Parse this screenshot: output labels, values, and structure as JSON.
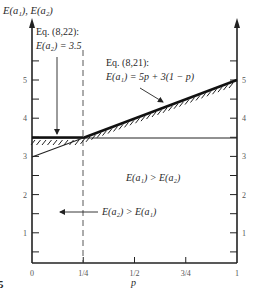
{
  "figure": {
    "y_axis_label": "E(a₁), E(a₂)",
    "x_axis_label": "p",
    "figure_number_fragment": "5",
    "x_ticks": [
      {
        "value": 0,
        "label": "0"
      },
      {
        "value": 0.25,
        "label": "1/4"
      },
      {
        "value": 0.5,
        "label": "1/2"
      },
      {
        "value": 0.75,
        "label": "3/4"
      },
      {
        "value": 1,
        "label": "1"
      }
    ],
    "y_ticks_labeled": [
      {
        "value": 1,
        "label": "1"
      },
      {
        "value": 2,
        "label": "2"
      },
      {
        "value": 3,
        "label": "3"
      },
      {
        "value": 4,
        "label": "4"
      },
      {
        "value": 5,
        "label": "5"
      }
    ],
    "y_minor_ticks": [
      0.5,
      1.5,
      2.5,
      3.5,
      4.5,
      5.5
    ],
    "annotations": {
      "eq822_line1": "Eq. (8,22):",
      "eq822_line2": "E(a₂) = 3.5",
      "eq821_line1": "Eq. (8,21):",
      "eq821_line2": "E(a₁) = 5p + 3(1 − p)",
      "region_right": "E(a₁) > E(a₂)",
      "region_left": "E(a₂) > E(a₁)"
    },
    "lines": [
      {
        "name": "E(a2)",
        "equation": "3.5",
        "points": [
          [
            0,
            3.5
          ],
          [
            1,
            3.5
          ]
        ]
      },
      {
        "name": "E(a1)",
        "equation": "5p + 3(1 - p)",
        "points": [
          [
            0,
            3
          ],
          [
            1,
            5
          ]
        ]
      }
    ],
    "intersection": {
      "p": 0.25,
      "value": 3.5
    },
    "dashed_line_p": 0.25
  }
}
